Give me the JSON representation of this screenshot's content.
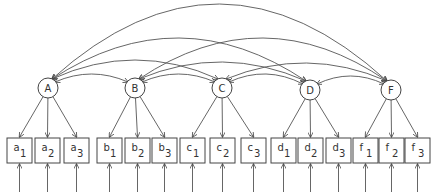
{
  "diagram": {
    "type": "structural-equation-model",
    "latent_factors": [
      {
        "id": "A",
        "label": "A",
        "cx": 48,
        "cy": 88
      },
      {
        "id": "B",
        "label": "B",
        "cx": 135,
        "cy": 88
      },
      {
        "id": "C",
        "label": "C",
        "cx": 222,
        "cy": 88
      },
      {
        "id": "D",
        "label": "D",
        "cx": 310,
        "cy": 90
      },
      {
        "id": "F",
        "label": "F",
        "cx": 391,
        "cy": 90
      }
    ],
    "indicators": [
      {
        "id": "a1",
        "letter": "a",
        "sub": "1",
        "factor": "A",
        "x": 7
      },
      {
        "id": "a2",
        "letter": "a",
        "sub": "2",
        "factor": "A",
        "x": 35
      },
      {
        "id": "a3",
        "letter": "a",
        "sub": "3",
        "factor": "A",
        "x": 64
      },
      {
        "id": "b1",
        "letter": "b",
        "sub": "1",
        "factor": "B",
        "x": 97
      },
      {
        "id": "b2",
        "letter": "b",
        "sub": "2",
        "factor": "B",
        "x": 125
      },
      {
        "id": "b3",
        "letter": "b",
        "sub": "3",
        "factor": "B",
        "x": 152
      },
      {
        "id": "c1",
        "letter": "c",
        "sub": "1",
        "factor": "C",
        "x": 180
      },
      {
        "id": "c2",
        "letter": "c",
        "sub": "2",
        "factor": "C",
        "x": 210
      },
      {
        "id": "c3",
        "letter": "c",
        "sub": "3",
        "factor": "C",
        "x": 241
      },
      {
        "id": "d1",
        "letter": "d",
        "sub": "1",
        "factor": "D",
        "x": 271
      },
      {
        "id": "d2",
        "letter": "d",
        "sub": "2",
        "factor": "D",
        "x": 298
      },
      {
        "id": "d3",
        "letter": "d",
        "sub": "3",
        "factor": "D",
        "x": 326
      },
      {
        "id": "f1",
        "letter": "f",
        "sub": "1",
        "factor": "F",
        "x": 353
      },
      {
        "id": "f2",
        "letter": "f",
        "sub": "2",
        "factor": "F",
        "x": 379
      },
      {
        "id": "f3",
        "letter": "f",
        "sub": "3",
        "factor": "F",
        "x": 405
      }
    ],
    "box": {
      "y": 138,
      "w": 25,
      "h": 25
    },
    "error_arrow": {
      "y_start": 192,
      "y_end": 164
    },
    "covariances": [
      {
        "from": "A",
        "to": "B",
        "peak": 74
      },
      {
        "from": "B",
        "to": "C",
        "peak": 74
      },
      {
        "from": "C",
        "to": "D",
        "peak": 74
      },
      {
        "from": "D",
        "to": "F",
        "peak": 76
      },
      {
        "from": "A",
        "to": "C",
        "peak": 60
      },
      {
        "from": "B",
        "to": "D",
        "peak": 62
      },
      {
        "from": "C",
        "to": "F",
        "peak": 63
      },
      {
        "from": "A",
        "to": "D",
        "peak": 38
      },
      {
        "from": "B",
        "to": "F",
        "peak": 38
      },
      {
        "from": "A",
        "to": "F",
        "peak": 4
      }
    ]
  }
}
